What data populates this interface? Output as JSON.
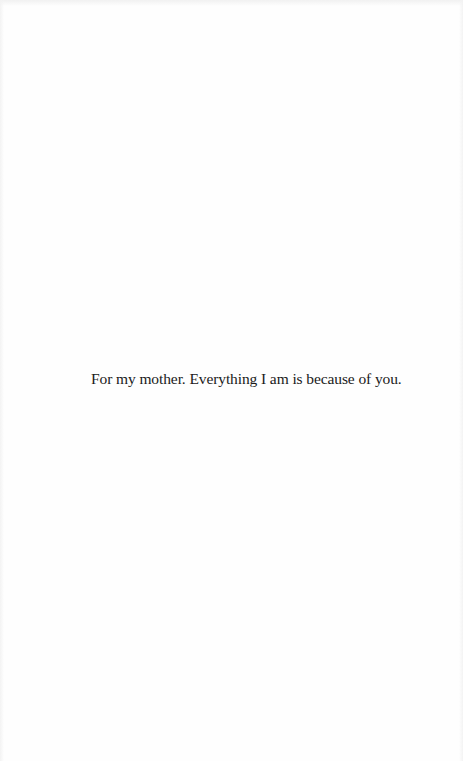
{
  "page": {
    "type": "dedication",
    "text": "For my mother. Everything I am is because of you."
  },
  "colors": {
    "background": "#fefefe",
    "text": "#1a1a1a"
  }
}
